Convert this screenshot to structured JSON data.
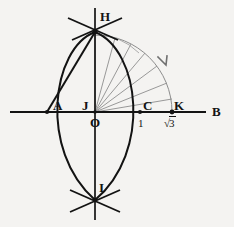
{
  "figure": {
    "background_color": "#f4f3f1",
    "stroke_color": "#131313",
    "gray_color": "#8d8d8d",
    "width": 234,
    "height": 227
  },
  "axes": {
    "x_axis": {
      "label": "B",
      "y": 112,
      "x_start": 10,
      "x_end": 208
    },
    "y_axis": {
      "x": 95,
      "y_start": 8,
      "y_end": 220
    }
  },
  "points": [
    {
      "id": "H",
      "label": "H",
      "x": 95,
      "y": 31,
      "label_x": 100,
      "label_y": 13,
      "dot": false
    },
    {
      "id": "A",
      "label": "A",
      "x": 47,
      "y": 112,
      "label_x": 52,
      "label_y": 103,
      "dot": true
    },
    {
      "id": "J",
      "label": "J",
      "x": 88,
      "y": 112,
      "label_x": 84,
      "label_y": 103,
      "dot": false
    },
    {
      "id": "O",
      "label": "O",
      "x": 95,
      "y": 112,
      "label_x": 92,
      "label_y": 117,
      "dot": false
    },
    {
      "id": "C",
      "label": "C",
      "x": 140,
      "y": 112,
      "label_x": 143,
      "label_y": 103,
      "dot": true
    },
    {
      "id": "K",
      "label": "K",
      "x": 172,
      "y": 112,
      "label_x": 175,
      "label_y": 103,
      "dot": true
    },
    {
      "id": "B",
      "label": "B",
      "x": 208,
      "y": 112,
      "label_x": 212,
      "label_y": 106,
      "dot": false
    },
    {
      "id": "I",
      "label": "I",
      "x": 95,
      "y": 200,
      "label_x": 99,
      "label_y": 183,
      "dot": false
    }
  ],
  "value_labels": [
    {
      "id": "one",
      "text": "1",
      "x": 137,
      "y": 119,
      "kind": "plain"
    },
    {
      "id": "sqrt3",
      "text": "3",
      "x": 166,
      "y": 120,
      "kind": "radical"
    }
  ],
  "arcs": {
    "left_big_arc": "Large black arc from H curving left through A down to I",
    "right_big_arc": "Large black arc from H curving right through C down to I",
    "chord_AH": "Straight black chord from A to H",
    "unit_arc": "Gray quarter arc of radius OK from K up to H",
    "tick_H": "Short crossing construction ticks at H",
    "tick_I": "Short crossing construction ticks at I"
  },
  "rays": {
    "description": "Fan of gray rays from origin O toward the quarter arc",
    "count": 6,
    "angles_deg": [
      90,
      75,
      62,
      50,
      37,
      22
    ]
  },
  "arrow": {
    "id": "rotation-arrow",
    "description": "Arrowhead on outer gray arc indicating clockwise sweep",
    "x": 164,
    "y": 62
  }
}
